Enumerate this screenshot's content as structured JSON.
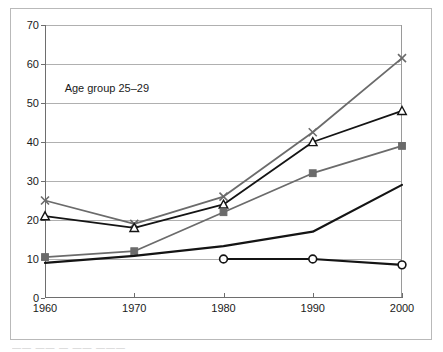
{
  "chart_data": {
    "type": "line",
    "title": "",
    "annotation": "Age group 25–29",
    "xlabel": "",
    "ylabel": "",
    "x": [
      1960,
      1970,
      1980,
      1990,
      2000
    ],
    "xtick_labels": [
      "1960",
      "1970",
      "1980",
      "1990",
      "2000"
    ],
    "ytick_labels": [
      "0",
      "10",
      "20",
      "30",
      "40",
      "50",
      "60",
      "70"
    ],
    "yticks": [
      0,
      10,
      20,
      30,
      40,
      50,
      60,
      70
    ],
    "ylim": [
      0,
      70
    ],
    "xlim": [
      1960,
      2000
    ],
    "grid": "horizontal",
    "legend_position": "none",
    "series": [
      {
        "name": "series-x-gray",
        "marker": "x",
        "color": "#6b6b6b",
        "x": [
          1960,
          1970,
          1980,
          1990,
          2000
        ],
        "values": [
          25.0,
          19.0,
          26.0,
          42.5,
          61.5
        ]
      },
      {
        "name": "series-triangle-black",
        "marker": "triangle",
        "color": "#141414",
        "x": [
          1960,
          1970,
          1980,
          1990,
          2000
        ],
        "values": [
          21.0,
          18.0,
          24.0,
          40.0,
          48.0
        ]
      },
      {
        "name": "series-square-gray",
        "marker": "square",
        "color": "#6b6b6b",
        "x": [
          1960,
          1970,
          1980,
          1990,
          2000
        ],
        "values": [
          10.5,
          12.0,
          22.0,
          32.0,
          39.0
        ]
      },
      {
        "name": "series-plain-black",
        "marker": "none",
        "color": "#141414",
        "x": [
          1960,
          1970,
          1980,
          1990,
          2000
        ],
        "values": [
          9.0,
          10.8,
          13.3,
          17.0,
          29.0
        ]
      },
      {
        "name": "series-circle-black",
        "marker": "circle",
        "color": "#141414",
        "x": [
          1980,
          1990,
          2000
        ],
        "values": [
          10.0,
          10.0,
          8.5
        ]
      }
    ]
  },
  "footer": {
    "fragment": "——  —— — —— ———"
  }
}
